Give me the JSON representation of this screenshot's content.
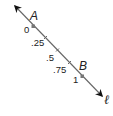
{
  "diagram": {
    "line_name": "ℓ",
    "points": [
      {
        "name": "A",
        "value": "0"
      },
      {
        "name": "B",
        "value": "1"
      }
    ],
    "ticks": [
      ".25",
      ".5",
      ".75"
    ],
    "colors": {
      "line": "#555555",
      "point": "#777777",
      "text": "#222222"
    }
  }
}
